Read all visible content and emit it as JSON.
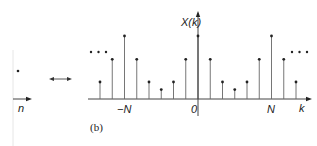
{
  "figure": {
    "caption": "(b)",
    "transform_arrow": "⟷",
    "left_panel": {
      "axis_label": "n"
    },
    "right_panel": {
      "y_label": "X(k)",
      "x_label": "k",
      "tick_labels": [
        "−N",
        "0",
        "N"
      ],
      "ellipsis": "• • •"
    }
  },
  "chart_data": {
    "type": "stem",
    "title": "",
    "xlabel": "k",
    "ylabel": "X(k)",
    "period_N": 6,
    "x": [
      -8,
      -7,
      -6,
      -5,
      -4,
      -3,
      -2,
      -1,
      0,
      1,
      2,
      3,
      4,
      5,
      6,
      7,
      8
    ],
    "values": [
      0.27,
      0.63,
      1.0,
      0.63,
      0.27,
      0.15,
      0.27,
      0.63,
      1.0,
      0.63,
      0.27,
      0.15,
      0.27,
      0.63,
      1.0,
      0.63,
      0.27
    ],
    "tick_labels": {
      "-6": "−N",
      "0": "0",
      "6": "N"
    }
  },
  "colors": {
    "ink": "#222222",
    "stem": "#555555",
    "faint": "#cccccc"
  }
}
